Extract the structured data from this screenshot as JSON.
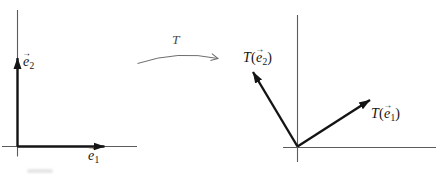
{
  "figure": {
    "glyphs": {
      "vec_arrow": "→"
    },
    "colors": {
      "axis": "#5b5b5b",
      "vector": "#141414",
      "text": "#141414",
      "map_arrow": "#6e6e6e",
      "map_label_text": "#4d4d4d",
      "background": "#ffffff"
    },
    "left_panel": {
      "e2_label": {
        "base": "e",
        "sub": "2"
      },
      "e1_label": {
        "base": "e",
        "sub": "1"
      }
    },
    "map": {
      "label": "T"
    },
    "right_panel": {
      "Te2_label": {
        "func": "T",
        "open": "(",
        "base": "e",
        "sub": "2",
        "close": ")"
      },
      "Te1_label": {
        "func": "T",
        "open": "(",
        "base": "e",
        "sub": "1",
        "close": ")"
      }
    }
  }
}
